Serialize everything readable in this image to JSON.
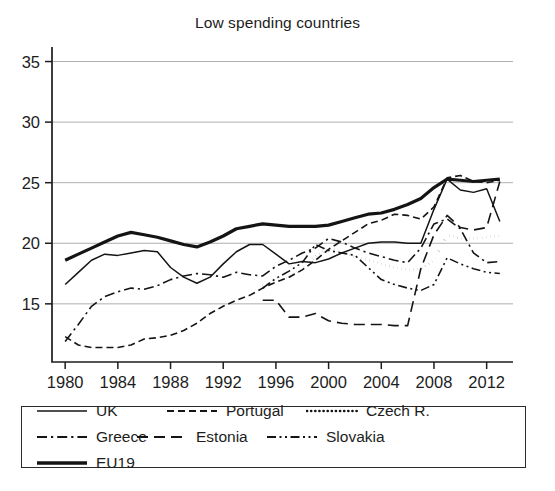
{
  "chart_data": {
    "type": "line",
    "title": "Low spending countries",
    "xlabel": "",
    "ylabel": "",
    "xlim": [
      1979,
      2014
    ],
    "ylim": [
      10.2,
      36.2
    ],
    "grid": "horizontal",
    "legend_position": "bottom",
    "x_ticks": [
      1980,
      1984,
      1988,
      1992,
      1996,
      2000,
      2004,
      2008,
      2012
    ],
    "y_ticks": [
      15,
      20,
      25,
      30,
      35
    ],
    "x": [
      1980,
      1981,
      1982,
      1983,
      1984,
      1985,
      1986,
      1987,
      1988,
      1989,
      1990,
      1991,
      1992,
      1993,
      1994,
      1995,
      1996,
      1997,
      1998,
      1999,
      2000,
      2001,
      2002,
      2003,
      2004,
      2005,
      2006,
      2007,
      2008,
      2009,
      2010,
      2011,
      2012,
      2013
    ],
    "series": [
      {
        "name": "UK",
        "style": "solid",
        "width": 1.5,
        "values": [
          16.6,
          17.6,
          18.6,
          19.1,
          19.0,
          19.2,
          19.4,
          19.3,
          18.0,
          17.2,
          16.7,
          17.2,
          18.3,
          19.3,
          19.9,
          19.9,
          19.1,
          18.3,
          18.5,
          18.4,
          18.7,
          19.2,
          19.6,
          20.0,
          20.1,
          20.1,
          20.0,
          20.0,
          22.8,
          25.3,
          24.4,
          24.2,
          24.5,
          21.8
        ]
      },
      {
        "name": "Portugal",
        "style": "dashed",
        "width": 1.6,
        "values": [
          12.3,
          11.6,
          11.4,
          11.4,
          11.4,
          11.6,
          12.1,
          12.2,
          12.4,
          12.8,
          13.4,
          14.2,
          14.8,
          15.3,
          15.7,
          16.3,
          16.8,
          17.2,
          17.8,
          18.6,
          19.5,
          20.2,
          20.9,
          21.6,
          21.9,
          22.4,
          22.3,
          22.0,
          23.0,
          25.4,
          25.6,
          25.1,
          25.0,
          25.2
        ]
      },
      {
        "name": "Czech R.",
        "style": "dotted",
        "width": 2.6,
        "values": [
          null,
          null,
          null,
          null,
          null,
          null,
          null,
          null,
          null,
          null,
          null,
          null,
          null,
          null,
          null,
          16.5,
          16.9,
          17.2,
          17.9,
          18.9,
          19.6,
          19.3,
          18.9,
          18.6,
          18.3,
          18.0,
          17.8,
          17.9,
          18.6,
          20.7,
          20.4,
          20.4,
          20.5,
          20.6
        ]
      },
      {
        "name": "Greece",
        "style": "dashdot",
        "width": 1.6,
        "values": [
          11.9,
          13.3,
          14.8,
          15.6,
          16.0,
          16.3,
          16.2,
          16.5,
          17.0,
          17.3,
          17.5,
          17.4,
          17.2,
          17.6,
          17.4,
          17.3,
          18.1,
          18.6,
          19.2,
          19.6,
          20.4,
          20.1,
          19.6,
          19.2,
          18.9,
          18.6,
          18.4,
          19.6,
          21.6,
          22.0,
          21.2,
          19.2,
          18.4,
          18.5
        ]
      },
      {
        "name": "Estonia",
        "style": "longdash",
        "width": 1.6,
        "values": [
          null,
          null,
          null,
          null,
          null,
          null,
          null,
          null,
          null,
          null,
          null,
          null,
          null,
          null,
          null,
          15.3,
          15.3,
          13.9,
          13.9,
          14.2,
          13.6,
          13.4,
          13.3,
          13.3,
          13.3,
          13.2,
          13.2,
          17.9,
          20.7,
          22.3,
          21.3,
          21.1,
          21.3,
          25.1
        ]
      },
      {
        "name": "Slovakia",
        "style": "dashdotdot",
        "width": 1.6,
        "values": [
          null,
          null,
          null,
          null,
          null,
          null,
          null,
          null,
          null,
          null,
          null,
          null,
          null,
          null,
          null,
          16.3,
          17.1,
          17.7,
          18.4,
          19.9,
          19.4,
          19.2,
          19.0,
          18.0,
          17.0,
          16.6,
          16.3,
          16.1,
          16.6,
          18.8,
          18.3,
          17.9,
          17.6,
          17.5
        ]
      },
      {
        "name": "EU19",
        "style": "solid",
        "width": 3.2,
        "values": [
          18.6,
          19.1,
          19.6,
          20.1,
          20.6,
          20.9,
          20.7,
          20.5,
          20.2,
          19.9,
          19.7,
          20.1,
          20.6,
          21.2,
          21.4,
          21.6,
          21.5,
          21.4,
          21.4,
          21.4,
          21.5,
          21.8,
          22.1,
          22.4,
          22.5,
          22.8,
          23.2,
          23.7,
          24.6,
          25.3,
          25.2,
          25.1,
          25.2,
          25.3
        ]
      }
    ]
  },
  "legend": {
    "entries": [
      {
        "label": "UK",
        "style": "solid",
        "width": 1.6,
        "slot": "uk"
      },
      {
        "label": "Portugal",
        "style": "dashed",
        "width": 1.8,
        "slot": "portugal"
      },
      {
        "label": "Czech R.",
        "style": "dotted",
        "width": 2.6,
        "slot": "czech"
      },
      {
        "label": "Greece",
        "style": "dashdot",
        "width": 1.8,
        "slot": "greece"
      },
      {
        "label": "Estonia",
        "style": "longdash",
        "width": 1.8,
        "slot": "estonia"
      },
      {
        "label": "Slovakia",
        "style": "dashdotdot",
        "width": 1.8,
        "slot": "slovakia"
      },
      {
        "label": "EU19",
        "style": "solid",
        "width": 3.4,
        "slot": "eu19"
      }
    ]
  },
  "colors": {
    "ink": "#141414",
    "grid": "#9a9a9a",
    "axis": "#1d1d1d",
    "background": "#ffffff"
  }
}
